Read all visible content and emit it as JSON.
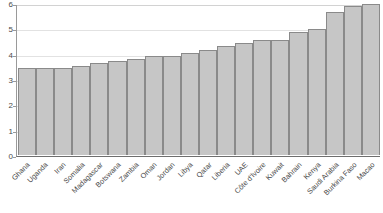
{
  "title_remnant": "",
  "axis": {
    "y_ticks": [
      "0",
      "1",
      "2",
      "3",
      "4",
      "5",
      "6"
    ],
    "y_min": 0,
    "y_max": 6
  },
  "colors": {
    "bar_fill": "#c6c6c6",
    "bar_border": "#8a8a8a",
    "gridline": "#e2e2e2",
    "axis_line": "#6e6e6e",
    "text": "#4a4a4a"
  },
  "chart_data": {
    "type": "bar",
    "title": "",
    "subtitle": "",
    "xlabel": "",
    "ylabel": "",
    "ylim": [
      0,
      6
    ],
    "grid": true,
    "legend": false,
    "orientation": "vertical",
    "sorted": "ascending",
    "categories": [
      "Ghana",
      "Uganda",
      "Iran",
      "Somalia",
      "Madagascar",
      "Botswana",
      "Zambia",
      "Oman",
      "Jordan",
      "Libya",
      "Qatar",
      "Liberia",
      "UAE",
      "Côte d'Ivoire",
      "Kuwait",
      "Bahrain",
      "Kenya",
      "Saudi Arabia",
      "Burkina Faso",
      "Macao"
    ],
    "values": [
      3.45,
      3.45,
      3.45,
      3.5,
      3.62,
      3.7,
      3.8,
      3.9,
      3.9,
      4.03,
      4.13,
      4.32,
      4.42,
      4.55,
      4.55,
      4.85,
      4.97,
      5.65,
      5.87,
      5.97
    ],
    "tick_labels_y": [
      "0",
      "1",
      "2",
      "3",
      "4",
      "5",
      "6"
    ]
  }
}
